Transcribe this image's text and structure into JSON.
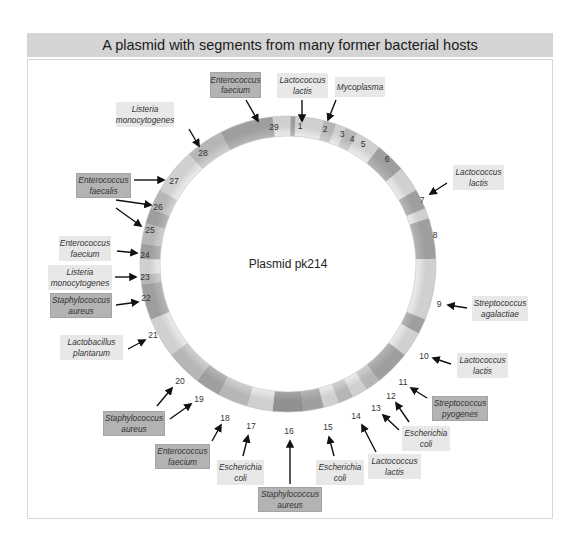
{
  "header": {
    "title": "A plasmid with segments from many former bacterial hosts"
  },
  "plasmid": {
    "name": "Plasmid pk214",
    "center": [
      288,
      264
    ],
    "outer_radius": 148,
    "inner_radius": 128
  },
  "colors": {
    "header_bg": "#d4d4d4",
    "label_light": "#e8e8e8",
    "label_dark": "#b3b3b3",
    "arrow": "#111111",
    "ring_light": "#ececec",
    "ring_mid": "#cfcfcf",
    "ring_dark": "#a9a9a9"
  },
  "segments": [
    {
      "num": "1",
      "x": 300,
      "y": 126
    },
    {
      "num": "2",
      "x": 325,
      "y": 129
    },
    {
      "num": "3",
      "x": 342,
      "y": 134
    },
    {
      "num": "4",
      "x": 352,
      "y": 139
    },
    {
      "num": "5",
      "x": 363,
      "y": 144
    },
    {
      "num": "6",
      "x": 387,
      "y": 159
    },
    {
      "num": "7",
      "x": 422,
      "y": 200
    },
    {
      "num": "8",
      "x": 435,
      "y": 235
    },
    {
      "num": "9",
      "x": 439,
      "y": 304
    },
    {
      "num": "10",
      "x": 424,
      "y": 356
    },
    {
      "num": "11",
      "x": 403,
      "y": 382
    },
    {
      "num": "12",
      "x": 391,
      "y": 396
    },
    {
      "num": "13",
      "x": 376,
      "y": 408
    },
    {
      "num": "14",
      "x": 356,
      "y": 416
    },
    {
      "num": "15",
      "x": 328,
      "y": 427
    },
    {
      "num": "16",
      "x": 289,
      "y": 431
    },
    {
      "num": "17",
      "x": 251,
      "y": 426
    },
    {
      "num": "18",
      "x": 225,
      "y": 418
    },
    {
      "num": "19",
      "x": 199,
      "y": 399
    },
    {
      "num": "20",
      "x": 180,
      "y": 381
    },
    {
      "num": "21",
      "x": 153,
      "y": 335
    },
    {
      "num": "22",
      "x": 146,
      "y": 298
    },
    {
      "num": "23",
      "x": 145,
      "y": 277
    },
    {
      "num": "24",
      "x": 145,
      "y": 255
    },
    {
      "num": "25",
      "x": 150,
      "y": 230
    },
    {
      "num": "26",
      "x": 158,
      "y": 207
    },
    {
      "num": "27",
      "x": 174,
      "y": 181
    },
    {
      "num": "28",
      "x": 203,
      "y": 153
    },
    {
      "num": "29",
      "x": 274,
      "y": 127
    }
  ],
  "hosts": [
    {
      "name": "Enterococcus faecium",
      "segment": "29",
      "shade": "dark",
      "box": [
        210,
        72,
        51,
        26
      ]
    },
    {
      "name": "Lactococcus lactis",
      "segment": "1",
      "shade": "light",
      "box": [
        277,
        73,
        51,
        25
      ]
    },
    {
      "name": "Mycoplasma",
      "segment": "2",
      "shade": "light",
      "box": [
        335,
        77,
        50,
        20
      ]
    },
    {
      "name": "Listeria monocytogenes",
      "segment": "28",
      "shade": "light",
      "box": [
        116,
        102,
        58,
        25
      ]
    },
    {
      "name": "Enterococcus faecalis",
      "segment": "27, 26, 25",
      "shade": "dark",
      "box": [
        76,
        173,
        55,
        25
      ]
    },
    {
      "name": "Enterococcus faecium",
      "segment": "24",
      "shade": "light",
      "box": [
        59,
        236,
        52,
        25
      ]
    },
    {
      "name": "Listeria monocytogenes",
      "segment": "23",
      "shade": "light",
      "box": [
        48,
        265,
        64,
        25
      ]
    },
    {
      "name": "Staphylococcus aureus",
      "segment": "22",
      "shade": "dark",
      "box": [
        50,
        293,
        62,
        25
      ]
    },
    {
      "name": "Lactobacillus plantarum",
      "segment": "21",
      "shade": "light",
      "box": [
        60,
        335,
        63,
        25
      ]
    },
    {
      "name": "Staphylococcus aureus",
      "segment": "20, 19",
      "shade": "dark",
      "box": [
        103,
        411,
        62,
        25
      ]
    },
    {
      "name": "Enterococcus faecium",
      "segment": "18",
      "shade": "dark",
      "box": [
        155,
        444,
        55,
        25
      ]
    },
    {
      "name": "Escherichia coli",
      "segment": "17",
      "shade": "light",
      "box": [
        217,
        460,
        47,
        25
      ]
    },
    {
      "name": "Staphylococcus aureus",
      "segment": "16",
      "shade": "dark",
      "box": [
        258,
        487,
        64,
        25
      ]
    },
    {
      "name": "Escherichia coli",
      "segment": "15",
      "shade": "light",
      "box": [
        316,
        460,
        48,
        25
      ]
    },
    {
      "name": "Lactococcus lactis",
      "segment": "14",
      "shade": "light",
      "box": [
        368,
        454,
        53,
        25
      ]
    },
    {
      "name": "Escherichia coli",
      "segment": "13, 12",
      "shade": "light",
      "box": [
        402,
        426,
        48,
        25
      ]
    },
    {
      "name": "Streptococcus pyogenes",
      "segment": "11",
      "shade": "dark",
      "box": [
        432,
        396,
        56,
        25
      ]
    },
    {
      "name": "Lactococcus lactis",
      "segment": "10",
      "shade": "light",
      "box": [
        457,
        353,
        51,
        25
      ]
    },
    {
      "name": "Streptococcus agalactiae",
      "segment": "9",
      "shade": "light",
      "box": [
        472,
        296,
        56,
        25
      ]
    },
    {
      "name": "Lactococcus lactis",
      "segment": "7",
      "shade": "light",
      "box": [
        453,
        165,
        51,
        25
      ]
    }
  ],
  "arrows": [
    {
      "from": [
        246,
        100
      ],
      "to": [
        258,
        121
      ],
      "segment": "29"
    },
    {
      "from": [
        302,
        100
      ],
      "to": [
        302,
        121
      ],
      "segment": "1"
    },
    {
      "from": [
        336,
        100
      ],
      "to": [
        328,
        120
      ],
      "segment": "2"
    },
    {
      "from": [
        189,
        129
      ],
      "to": [
        199,
        146
      ],
      "segment": "28"
    },
    {
      "from": [
        134,
        180
      ],
      "to": [
        164,
        180
      ],
      "segment": "27"
    },
    {
      "from": [
        116,
        200
      ],
      "to": [
        151,
        205
      ],
      "segment": "26"
    },
    {
      "from": [
        116,
        208
      ],
      "to": [
        141,
        226
      ],
      "segment": "25"
    },
    {
      "from": [
        117,
        251
      ],
      "to": [
        137,
        253
      ],
      "segment": "24"
    },
    {
      "from": [
        115,
        277
      ],
      "to": [
        136,
        277
      ],
      "segment": "23"
    },
    {
      "from": [
        116,
        305
      ],
      "to": [
        138,
        302
      ],
      "segment": "22"
    },
    {
      "from": [
        128,
        349
      ],
      "to": [
        145,
        340
      ],
      "segment": "21"
    },
    {
      "from": [
        157,
        406
      ],
      "to": [
        172,
        388
      ],
      "segment": "20"
    },
    {
      "from": [
        170,
        419
      ],
      "to": [
        191,
        404
      ],
      "segment": "19"
    },
    {
      "from": [
        212,
        441
      ],
      "to": [
        221,
        425
      ],
      "segment": "18"
    },
    {
      "from": [
        243,
        456
      ],
      "to": [
        248,
        436
      ],
      "segment": "17"
    },
    {
      "from": [
        290,
        484
      ],
      "to": [
        290,
        441
      ],
      "segment": "16"
    },
    {
      "from": [
        334,
        456
      ],
      "to": [
        329,
        437
      ],
      "segment": "15"
    },
    {
      "from": [
        376,
        452
      ],
      "to": [
        362,
        425
      ],
      "segment": "14"
    },
    {
      "from": [
        399,
        430
      ],
      "to": [
        383,
        415
      ],
      "segment": "13"
    },
    {
      "from": [
        409,
        422
      ],
      "to": [
        396,
        403
      ],
      "segment": "12"
    },
    {
      "from": [
        427,
        398
      ],
      "to": [
        411,
        388
      ],
      "segment": "11"
    },
    {
      "from": [
        451,
        364
      ],
      "to": [
        433,
        358
      ],
      "segment": "10"
    },
    {
      "from": [
        467,
        308
      ],
      "to": [
        448,
        305
      ],
      "segment": "9"
    },
    {
      "from": [
        447,
        183
      ],
      "to": [
        430,
        194
      ],
      "segment": "7"
    }
  ]
}
